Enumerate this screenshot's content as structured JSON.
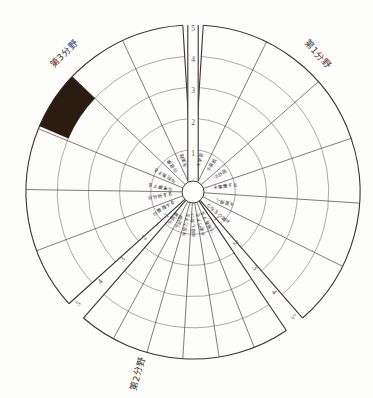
{
  "chart_data": {
    "type": "radar",
    "scale": {
      "min": 0,
      "max": 5,
      "ticks": [
        "1",
        "2",
        "3",
        "4",
        "5"
      ],
      "rings": 5
    },
    "axis_tick_labels_top": [
      "5",
      "4",
      "3",
      "2",
      "1"
    ],
    "axis_tick_labels_lower_left": [
      "1",
      "2",
      "3",
      "4",
      "5"
    ],
    "axis_tick_labels_lower_right": [
      "1",
      "2",
      "3",
      "4",
      "5"
    ],
    "grid": true,
    "legend_position": "none",
    "fields": [
      {
        "id": "field1",
        "label": "第1分野",
        "position": "upper-right"
      },
      {
        "id": "field2",
        "label": "第2分野",
        "position": "lower-left"
      },
      {
        "id": "field3",
        "label": "第3分野",
        "position": "upper-left"
      }
    ],
    "categories": [
      {
        "index": 1,
        "marker": "①",
        "label": "学習",
        "field": "field1"
      },
      {
        "index": 2,
        "marker": "②",
        "label": "意欲",
        "field": "field1"
      },
      {
        "index": 3,
        "marker": "③",
        "label": "計画",
        "field": "field1"
      },
      {
        "index": 4,
        "marker": "④",
        "label": "準備する",
        "field": "field1"
      },
      {
        "index": 5,
        "marker": "⑤",
        "label": "習得へ",
        "field": "field1"
      },
      {
        "index": 6,
        "marker": "⑥",
        "label": "関心をもつ",
        "field": "field1"
      },
      {
        "index": 7,
        "marker": "⑦",
        "label": "発表する",
        "field": "field2"
      },
      {
        "index": 8,
        "marker": "⑧",
        "label": "実行する",
        "field": "field2"
      },
      {
        "index": 9,
        "marker": "⑨",
        "label": "話し合い",
        "field": "field2"
      },
      {
        "index": 10,
        "marker": "⑩",
        "label": "協力する",
        "field": "field2"
      },
      {
        "index": 11,
        "marker": "⑪",
        "label": "記録",
        "field": "field2"
      },
      {
        "index": 12,
        "marker": "⑫",
        "label": "調査",
        "field": "field2"
      },
      {
        "index": 13,
        "marker": "⑬",
        "label": "整理する",
        "field": "field3"
      },
      {
        "index": 14,
        "marker": "⑭",
        "label": "分析する",
        "field": "field3"
      },
      {
        "index": 15,
        "marker": "⑮",
        "label": "考察する",
        "field": "field3"
      },
      {
        "index": 16,
        "marker": "⑯",
        "label": "判断する",
        "field": "field3"
      },
      {
        "index": 17,
        "marker": "⑰",
        "label": "健康",
        "field": "field3"
      },
      {
        "index": 18,
        "marker": "⑱",
        "label": "実践",
        "field": "field3"
      }
    ],
    "values": [
      0,
      0,
      0,
      0,
      0,
      0,
      0,
      0,
      0,
      0,
      0,
      0,
      0,
      0,
      0,
      0,
      0,
      0
    ],
    "highlighted_cells": [
      {
        "category_index": 16,
        "ring_from": 4,
        "ring_to": 5,
        "fill": "#2b1c12"
      }
    ],
    "colors": {
      "grid": "#4a4540",
      "outline": "#3a3530",
      "fill": "#2b1c12",
      "background": "#fdfdfc"
    }
  },
  "meta": {
    "field1_label": "第1分野",
    "field2_label": "第2分野",
    "field3_label": "第3分野"
  }
}
